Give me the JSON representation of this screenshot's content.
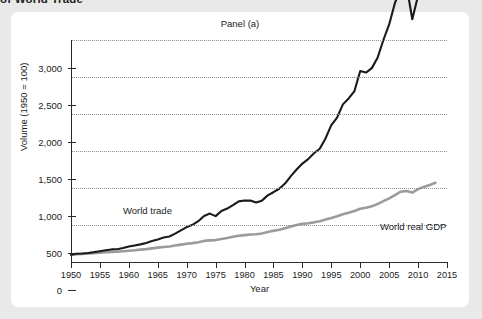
{
  "figure": {
    "clipped_caption": "of World Trade",
    "panel_title": "Panel (a)"
  },
  "chart_data": {
    "type": "line",
    "title": "Panel (a)",
    "xlabel": "Year",
    "ylabel": "Volume (1950 = 100)",
    "xlim": [
      1950,
      2015
    ],
    "ylim": [
      0,
      3000
    ],
    "grid": true,
    "legend_position": "inline-annotations",
    "x_ticks": [
      1950,
      1955,
      1960,
      1965,
      1970,
      1975,
      1980,
      1985,
      1990,
      1995,
      2000,
      2005,
      2010,
      2015
    ],
    "x_tick_labels": [
      "1950",
      "1955",
      "1960",
      "1965",
      "1970",
      "1975",
      "1980",
      "1985",
      "1990",
      "1995",
      "2000",
      "2005",
      "2010",
      "2015"
    ],
    "y_ticks": [
      0,
      500,
      1000,
      1500,
      2000,
      2500,
      3000
    ],
    "y_tick_labels": [
      "0",
      "500",
      "1,000",
      "1,500",
      "2,000",
      "2,500",
      "3,000"
    ],
    "x": [
      1950,
      1951,
      1952,
      1953,
      1954,
      1955,
      1956,
      1957,
      1958,
      1959,
      1960,
      1961,
      1962,
      1963,
      1964,
      1965,
      1966,
      1967,
      1968,
      1969,
      1970,
      1971,
      1972,
      1973,
      1974,
      1975,
      1976,
      1977,
      1978,
      1979,
      1980,
      1981,
      1982,
      1983,
      1984,
      1985,
      1986,
      1987,
      1988,
      1989,
      1990,
      1991,
      1992,
      1993,
      1994,
      1995,
      1996,
      1997,
      1998,
      1999,
      2000,
      2001,
      2002,
      2003,
      2004,
      2005,
      2006,
      2007,
      2008,
      2009,
      2010,
      2011,
      2012,
      2013
    ],
    "series": [
      {
        "name": "World trade",
        "color": "#1a1a1a",
        "label_x": 1968,
        "label_y": 620,
        "values": [
          100,
          112,
          115,
          122,
          133,
          146,
          159,
          170,
          172,
          188,
          210,
          224,
          238,
          256,
          283,
          305,
          330,
          344,
          383,
          428,
          471,
          503,
          551,
          623,
          654,
          620,
          690,
          722,
          768,
          819,
          830,
          832,
          805,
          829,
          900,
          943,
          990,
          1060,
          1160,
          1250,
          1330,
          1390,
          1470,
          1530,
          1670,
          1850,
          1950,
          2130,
          2210,
          2310,
          2580,
          2560,
          2620,
          2760,
          3000,
          3210,
          3500,
          3700,
          3740,
          3280,
          3600,
          3780,
          3820,
          3900
        ]
      },
      {
        "name": "World real GDP",
        "color": "#9b9b9b",
        "label_x": 2003,
        "label_y": 520,
        "values": [
          100,
          106,
          110,
          115,
          119,
          126,
          131,
          136,
          139,
          146,
          153,
          159,
          167,
          174,
          184,
          194,
          203,
          210,
          222,
          235,
          246,
          255,
          268,
          285,
          292,
          296,
          312,
          325,
          340,
          354,
          363,
          371,
          374,
          385,
          404,
          421,
          436,
          455,
          480,
          500,
          515,
          524,
          536,
          550,
          573,
          595,
          619,
          646,
          665,
          689,
          720,
          733,
          752,
          783,
          823,
          860,
          905,
          950,
          960,
          938,
          985,
          1015,
          1040,
          1070
        ]
      }
    ],
    "annotations": [
      {
        "text": "World trade",
        "series": "World trade"
      },
      {
        "text": "World real GDP",
        "series": "World real GDP"
      }
    ]
  }
}
